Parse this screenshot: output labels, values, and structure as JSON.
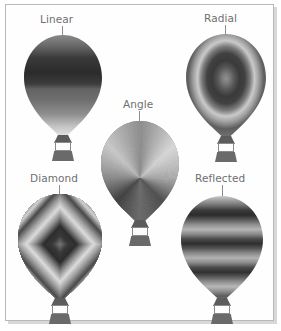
{
  "figure": {
    "background_color": "#ffffff",
    "frame_color": "#b9b9b9"
  },
  "labels": {
    "linear": "Linear",
    "radial": "Radial",
    "angle": "Angle",
    "diamond": "Diamond",
    "reflected": "Reflected"
  },
  "label_color": "#6f6f6f",
  "leader_color": "#8d8d8d",
  "balloons": [
    {
      "name": "linear",
      "label": "Linear",
      "gradient_type": "linear",
      "stops": [
        "#8a8a8a",
        "#5a5a5a",
        "#2f2f2f",
        "#3a3a3a",
        "#6e6e6e",
        "#8f8f8f",
        "#bdbdbd",
        "#e6e6e6"
      ]
    },
    {
      "name": "radial",
      "label": "Radial",
      "gradient_type": "radial",
      "stops": [
        "#8d8d8d",
        "#6c6c6c",
        "#3a3a3a",
        "#3c3c3c",
        "#8f8f8f",
        "#cfcfcf",
        "#9a9a9a",
        "#5d5d5d",
        "#7a7a7a",
        "#dcdcdc"
      ]
    },
    {
      "name": "angle",
      "label": "Angle",
      "gradient_type": "angle",
      "stops": [
        "#8e8e8e",
        "#d8d8d8",
        "#a9a9a9",
        "#4e4e4e",
        "#6b6b6b",
        "#3f3f3f",
        "#8c8c8c",
        "#c9c9c9",
        "#8e8e8e"
      ]
    },
    {
      "name": "diamond",
      "label": "Diamond",
      "gradient_type": "diamond",
      "stops": [
        "#7a7a7a",
        "#3a3a3a",
        "#2e2e2e",
        "#8d8d8d",
        "#dcdcdc",
        "#9a9a9a",
        "#4a4a4a",
        "#cfcfcf",
        "#8f8f8f",
        "#7c7c7c"
      ]
    },
    {
      "name": "reflected",
      "label": "Reflected",
      "gradient_type": "reflected",
      "stops": [
        "#b9b9b9",
        "#8a8a8a",
        "#4a4a4a",
        "#2e2e2e",
        "#6a6a6a",
        "#a5a5a5",
        "#7f7f7f",
        "#333333",
        "#7a7a7a",
        "#bdbdbd",
        "#8c8c8c"
      ]
    }
  ],
  "parts": {
    "envelope": "balloon-envelope",
    "neck": "balloon-neck",
    "burner": "balloon-burner",
    "basket": "balloon-basket"
  }
}
